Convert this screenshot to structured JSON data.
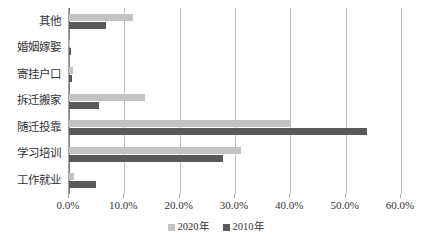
{
  "chart_data": {
    "type": "bar",
    "orientation": "horizontal",
    "title": "",
    "xlabel": "",
    "ylabel": "",
    "categories": [
      "工作就业",
      "学习培训",
      "随迁投靠",
      "拆迁搬家",
      "寄挂户口",
      "婚姻嫁娶",
      "其他"
    ],
    "categories_top_to_bottom": [
      "其他",
      "婚姻嫁娶",
      "寄挂户口",
      "拆迁搬家",
      "随迁投靠",
      "学习培训",
      "工作就业"
    ],
    "series": [
      {
        "name": "2020年",
        "color": "#c3c3c3",
        "values_top_to_bottom": [
          11.6,
          0.2,
          0.8,
          13.7,
          40.1,
          31.1,
          0.9
        ]
      },
      {
        "name": "2010年",
        "color": "#595959",
        "values_top_to_bottom": [
          6.7,
          0.3,
          0.6,
          5.4,
          53.9,
          27.8,
          4.9
        ]
      }
    ],
    "xlim": [
      0,
      60
    ],
    "xtick_values": [
      0,
      10,
      20,
      30,
      40,
      50,
      60
    ],
    "xtick_labels": [
      "0.0%",
      "10.0%",
      "20.0%",
      "30.0%",
      "40.0%",
      "50.0%",
      "60.0%"
    ],
    "grid": true,
    "legend_position": "bottom",
    "units": "percent"
  },
  "legend": {
    "items": [
      {
        "label": "2020年",
        "color": "#c3c3c3"
      },
      {
        "label": "2010年",
        "color": "#595959"
      }
    ]
  },
  "colors": {
    "series_2020": "#c3c3c3",
    "series_2010": "#595959",
    "gridline": "#bfbfbf",
    "axis": "#808080",
    "text": "#333333",
    "background": "#ffffff"
  }
}
